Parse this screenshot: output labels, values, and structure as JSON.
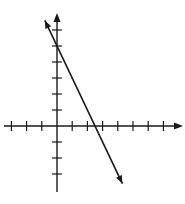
{
  "chart_data": {
    "type": "line",
    "title": "",
    "xlabel": "",
    "ylabel": "",
    "grid": false,
    "legend": null,
    "xlim": [
      -3,
      8
    ],
    "ylim": [
      -4,
      6
    ],
    "x_ticks": [
      -3,
      -2,
      -1,
      1,
      2,
      3,
      4,
      5,
      6,
      7
    ],
    "y_ticks": [
      -3,
      -2,
      -1,
      1,
      2,
      3,
      4,
      5,
      6
    ],
    "tick_labels_shown": false,
    "series": [
      {
        "name": "line",
        "equation": "y = -2x + 5",
        "slope": -2,
        "y_intercept": 5,
        "x_intercept": 2.5,
        "x": [
          -0.8,
          0,
          2.5,
          4.3
        ],
        "y": [
          6.6,
          5,
          0,
          -3.6
        ],
        "arrows_both_ends": true
      }
    ],
    "colors": {
      "axes": "#1a1a1a",
      "line": "#1a1a1a",
      "background": "#ffffff"
    }
  }
}
